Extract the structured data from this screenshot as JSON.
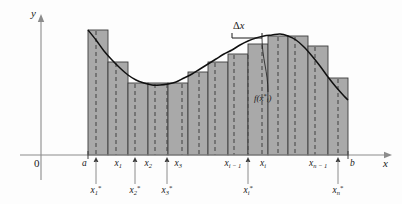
{
  "figure": {
    "type": "math-diagram",
    "width": 402,
    "height": 204,
    "colors": {
      "rectangle_fill": "#a9a9a9",
      "rectangle_stroke": "#3c3c3c",
      "curve": "#101010",
      "axis": "#8c8c8c",
      "dashed_sample_line": "#4a4a4a",
      "text": "#1a1a1a",
      "background": "#fdfdfd"
    }
  },
  "axes": {
    "y_axis_label": "y",
    "x_axis_label": "x",
    "origin_label": "0",
    "x_axis_y": 155,
    "y_axis_x": 41,
    "x_axis_start": 20,
    "x_axis_end": 392,
    "y_axis_top": 14,
    "y_axis_bottom": 180
  },
  "annotations": {
    "delta_x": "Δx",
    "delta_x_label": "Δ",
    "delta_x_var": "x",
    "function_value": "f(x",
    "function_value_star": "*",
    "function_value_sub": "i",
    "function_value_close": ")"
  },
  "partition_labels": [
    {
      "name": "a",
      "base": "a",
      "sub": "",
      "x": 88,
      "tick": true
    },
    {
      "name": "x1",
      "base": "x",
      "sub": "1",
      "x": 118,
      "tick": false
    },
    {
      "name": "x2",
      "base": "x",
      "sub": "2",
      "x": 148,
      "tick": false
    },
    {
      "name": "x3",
      "base": "x",
      "sub": "3",
      "x": 178,
      "tick": false
    },
    {
      "name": "xi-1",
      "base": "x",
      "sub": "i − 1",
      "x": 233,
      "tick": false
    },
    {
      "name": "xi",
      "base": "x",
      "sub": "i",
      "x": 263,
      "tick": false
    },
    {
      "name": "xn-1",
      "base": "x",
      "sub": "n − 1",
      "x": 318,
      "tick": false
    },
    {
      "name": "b",
      "base": "b",
      "sub": "",
      "x": 348,
      "tick": true
    }
  ],
  "sample_point_labels": [
    {
      "name": "x1*",
      "base": "x",
      "sub": "1",
      "x": 96,
      "tick_x": 96
    },
    {
      "name": "x2*",
      "base": "x",
      "sub": "2",
      "x": 135,
      "tick_x": 135
    },
    {
      "name": "x3*",
      "base": "x",
      "sub": "3",
      "x": 167,
      "tick_x": 167
    },
    {
      "name": "xi*",
      "base": "x",
      "sub": "i",
      "x": 248,
      "tick_x": 248
    },
    {
      "name": "xn*",
      "base": "x",
      "sub": "n",
      "x": 338,
      "tick_x": 338
    }
  ],
  "chart_data": {
    "type": "bar",
    "xlabel": "x",
    "ylabel": "y",
    "grid": false,
    "legend": false,
    "axis_baseline_y": 155,
    "rect_edges": [
      88,
      108,
      128,
      148,
      168,
      188,
      208,
      228,
      248,
      268,
      288,
      308,
      328,
      348
    ],
    "rect_tops": [
      30,
      62,
      83,
      83,
      83,
      72,
      62,
      54,
      44,
      36,
      36,
      46,
      78
    ],
    "rect_count": 13,
    "curve_points": [
      [
        88,
        30
      ],
      [
        96,
        40
      ],
      [
        104,
        51
      ],
      [
        112,
        60
      ],
      [
        120,
        68
      ],
      [
        128,
        75
      ],
      [
        136,
        80
      ],
      [
        144,
        83
      ],
      [
        152,
        85
      ],
      [
        160,
        85
      ],
      [
        168,
        84
      ],
      [
        176,
        82
      ],
      [
        184,
        78
      ],
      [
        192,
        74
      ],
      [
        200,
        69
      ],
      [
        208,
        64
      ],
      [
        216,
        59
      ],
      [
        224,
        54
      ],
      [
        232,
        50
      ],
      [
        240,
        45
      ],
      [
        248,
        41
      ],
      [
        256,
        38
      ],
      [
        264,
        36
      ],
      [
        272,
        35
      ],
      [
        280,
        34
      ],
      [
        288,
        36
      ],
      [
        296,
        40
      ],
      [
        304,
        47
      ],
      [
        312,
        56
      ],
      [
        320,
        66
      ],
      [
        328,
        77
      ],
      [
        336,
        87
      ],
      [
        344,
        96
      ],
      [
        348,
        100
      ]
    ],
    "sample_lines_x": [
      96,
      135,
      167,
      199,
      215,
      248,
      262,
      295,
      338
    ],
    "dashed_lines_x": [
      96,
      116,
      135,
      155,
      167,
      182,
      199,
      215,
      234,
      248,
      262,
      278,
      295,
      315,
      338
    ],
    "delta_x_bracket": {
      "left": 232,
      "right": 262,
      "y": 38
    }
  }
}
